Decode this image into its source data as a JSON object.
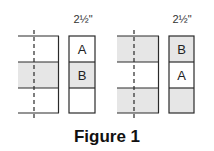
{
  "figure": {
    "caption": "Figure 1",
    "panels": [
      {
        "dimension_label": "2½\"",
        "strip_rows": [
          "white",
          "shaded",
          "white"
        ],
        "box_cells": [
          {
            "label": "A",
            "shade": "white"
          },
          {
            "label": "B",
            "shade": "shaded"
          },
          {
            "label": "",
            "shade": "white"
          }
        ]
      },
      {
        "dimension_label": "2½\"",
        "strip_rows": [
          "shaded",
          "white",
          "shaded"
        ],
        "box_cells": [
          {
            "label": "B",
            "shade": "shaded"
          },
          {
            "label": "A",
            "shade": "white"
          },
          {
            "label": "",
            "shade": "shaded"
          }
        ]
      }
    ]
  },
  "colors": {
    "line": "#2a2a2a",
    "shade": "#e6e6e6",
    "background": "#ffffff"
  }
}
